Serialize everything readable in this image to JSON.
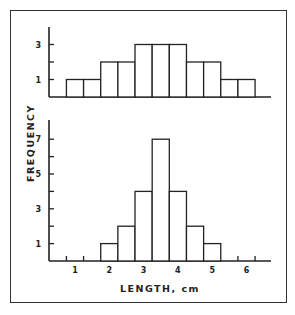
{
  "chart_data": [
    {
      "type": "bar",
      "title": "",
      "xlabel": "LENGTH, cm",
      "ylabel": "FREQUENCY",
      "bin_width": 0.5,
      "bin_starts": [
        0.75,
        1.25,
        1.75,
        2.25,
        2.75,
        3.25,
        3.75,
        4.25,
        4.75,
        5.25,
        5.75
      ],
      "values": [
        1,
        1,
        2,
        2,
        3,
        3,
        3,
        2,
        2,
        1,
        1
      ],
      "yticks": [
        1,
        2,
        3
      ],
      "ytick_labels": [
        "1",
        "",
        "3"
      ],
      "ylim": [
        0,
        4
      ],
      "grid": false
    },
    {
      "type": "bar",
      "title": "",
      "xlabel": "LENGTH, cm",
      "ylabel": "FREQUENCY",
      "bin_width": 0.5,
      "bin_starts": [
        1.75,
        2.25,
        2.75,
        3.25,
        3.75,
        4.25,
        4.75
      ],
      "values": [
        1,
        2,
        4,
        7,
        4,
        2,
        1
      ],
      "yticks": [
        1,
        2,
        3,
        4,
        5,
        6,
        7
      ],
      "ytick_labels": [
        "1",
        "",
        "3",
        "",
        "5",
        "",
        "7"
      ],
      "xticks": [
        0.75,
        1.25,
        5.75,
        6.25
      ],
      "xtick_labels": [
        "1",
        "2",
        "3",
        "4",
        "5",
        "6"
      ],
      "xtick_label_positions": [
        1,
        2,
        3,
        4,
        5,
        6
      ],
      "ylim": [
        0,
        8
      ],
      "grid": false
    }
  ],
  "labels": {
    "ylabel": "FREQUENCY",
    "xlabel": "LENGTH, cm"
  }
}
